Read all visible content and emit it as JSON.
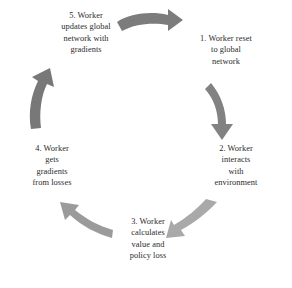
{
  "diagram": {
    "type": "cycle",
    "direction": "clockwise",
    "background_color": "#ffffff",
    "text_color": "#2b2b2b",
    "steps": [
      {
        "number": "1",
        "position": "top-right",
        "text": "1. Worker reset\nto global\nnetwork"
      },
      {
        "number": "2",
        "position": "right",
        "text": "2. Worker\ninteracts\nwith\nenvironment"
      },
      {
        "number": "3",
        "position": "bottom",
        "text": "3. Worker\ncalculates\nvalue and\npolicy loss"
      },
      {
        "number": "4",
        "position": "left",
        "text": "4. Worker\ngets\ngradients\nfrom losses"
      },
      {
        "number": "5",
        "position": "top-left",
        "text": "5. Worker\nupdates global\nnetwork with\ngradients"
      }
    ],
    "arrows": [
      {
        "name": "arrow-5-to-1",
        "from": "5",
        "to": "1",
        "direction": "rightward",
        "color": "#7c7c7c"
      },
      {
        "name": "arrow-1-to-2",
        "from": "1",
        "to": "2",
        "direction": "downward",
        "color": "#828282"
      },
      {
        "name": "arrow-2-to-3",
        "from": "2",
        "to": "3",
        "direction": "down-left",
        "color": "#a9a9a9"
      },
      {
        "name": "arrow-3-to-4",
        "from": "3",
        "to": "4",
        "direction": "up-left",
        "color": "#9b9b9b"
      },
      {
        "name": "arrow-4-to-5",
        "from": "4",
        "to": "5",
        "direction": "upward",
        "color": "#787878"
      }
    ]
  }
}
